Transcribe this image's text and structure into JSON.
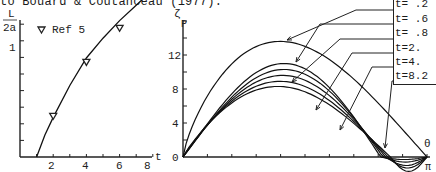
{
  "caption": "to Bouard & Coutanceau (1977).",
  "chart_data": [
    {
      "type": "line",
      "title": "",
      "xlabel": "t",
      "ylabel": "L/2a",
      "ylabel_num": "L",
      "ylabel_den": "2a",
      "xlim": [
        0,
        8.2
      ],
      "ylim": [
        0,
        1.65
      ],
      "xticks": [
        2,
        4,
        6,
        8
      ],
      "yticks_labeled": [
        1
      ],
      "legend": [
        {
          "marker": "inverted-triangle",
          "label": "Ref 5"
        }
      ],
      "series": [
        {
          "name": "computed",
          "x": [
            1.0,
            1.5,
            2.0,
            3.0,
            4.0,
            5.0,
            6.0,
            7.0,
            8.0,
            8.2
          ],
          "y": [
            0.0,
            0.2,
            0.36,
            0.65,
            0.9,
            1.08,
            1.24,
            1.38,
            1.52,
            1.55
          ]
        },
        {
          "name": "Ref 5",
          "marker": "inverted-triangle",
          "x": [
            2.0,
            4.0,
            6.0,
            8.0
          ],
          "y": [
            0.37,
            0.86,
            1.17,
            1.53
          ]
        }
      ],
      "grid": false
    },
    {
      "type": "line",
      "title": "",
      "xlabel": "θ",
      "xtick_end_label": "π",
      "ylabel": "ζP",
      "ylabel_main": "ζ",
      "ylabel_sub": "P",
      "xlim": [
        0,
        3.1416
      ],
      "ylim": [
        0,
        16
      ],
      "yticks": [
        0,
        4,
        8,
        12
      ],
      "ytick_labels": [
        "0",
        "4",
        "8",
        "12"
      ],
      "legend_position": "upper-right, with leader arrows",
      "series": [
        {
          "name": "t= .2",
          "peak": 13.6,
          "peak_theta": 1.25,
          "undershoot": 0.0
        },
        {
          "name": "t= .6",
          "peak": 11.0,
          "peak_theta": 1.3,
          "undershoot": -0.3
        },
        {
          "name": "t= .8",
          "peak": 10.3,
          "peak_theta": 1.3,
          "undershoot": -0.6
        },
        {
          "name": "t=2.",
          "peak": 9.6,
          "peak_theta": 1.28,
          "undershoot": -1.0
        },
        {
          "name": "t=4.",
          "peak": 8.9,
          "peak_theta": 1.25,
          "undershoot": -1.3
        },
        {
          "name": "t=8.2",
          "peak": 8.3,
          "peak_theta": 1.22,
          "undershoot": -1.7
        }
      ],
      "grid": false
    }
  ],
  "legend_right": [
    {
      "label": "t= .2"
    },
    {
      "label": "t= .6"
    },
    {
      "label": "t= .8"
    },
    {
      "label": "t=2."
    },
    {
      "label": "t=4."
    },
    {
      "label": "t=8.2"
    }
  ],
  "left_axis": {
    "tick_labels": {
      "x": [
        "2",
        "4",
        "6",
        "8"
      ],
      "y": [
        "1"
      ]
    },
    "xlabel": "t",
    "ylabel_num": "L",
    "ylabel_den": "2a",
    "legend_label": "Ref 5"
  },
  "right_axis": {
    "tick_labels": {
      "y": [
        "0",
        "4",
        "8",
        "12"
      ]
    },
    "xlabel": "θ",
    "xend": "π",
    "ylabel_main": "ζ",
    "ylabel_sub": "P"
  }
}
